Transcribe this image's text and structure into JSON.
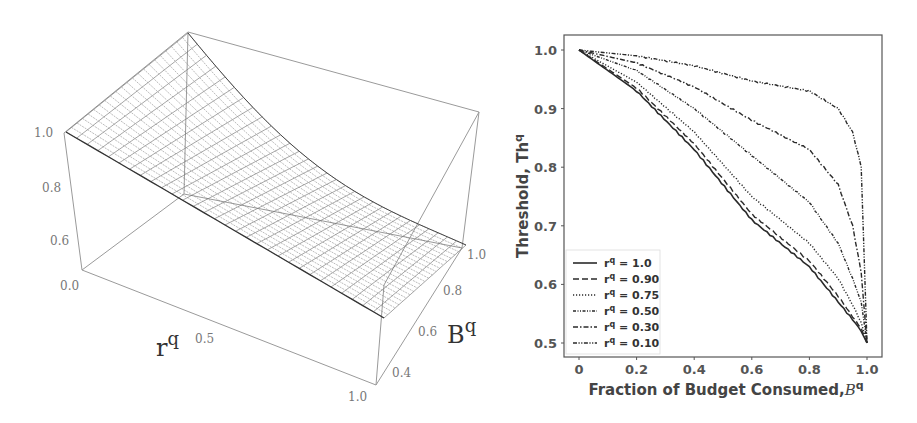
{
  "chart_data": [
    {
      "type": "surface3d",
      "title": "",
      "xlabel": "r^q",
      "ylabel": "B^q",
      "zlabel": "",
      "x_ticks": [
        "0.0",
        "0.5",
        "1.0"
      ],
      "y_ticks": [
        "0.4",
        "0.6",
        "0.8",
        "1.0"
      ],
      "z_ticks": [
        "0.6",
        "0.8",
        "1.0"
      ],
      "xlim": [
        0.0,
        1.0
      ],
      "ylim": [
        0.3,
        1.0
      ],
      "zlim": [
        0.5,
        1.0
      ],
      "description": "Wireframe surface: threshold equals 1.0 along r^q edge at B^q start, decaying toward ~0.5 as B^q approaches 1.0",
      "surface_color": "#555555"
    },
    {
      "type": "line",
      "title": "",
      "xlabel": "Fraction of Budget Consumed, B^q",
      "ylabel": "Threshold, Th^q",
      "xlim": [
        0,
        1.0
      ],
      "ylim": [
        0.5,
        1.0
      ],
      "x_ticks": [
        "0",
        "0.2",
        "0.4",
        "0.6",
        "0.8",
        "1.0"
      ],
      "y_ticks": [
        "0.5",
        "0.6",
        "0.7",
        "0.8",
        "0.9",
        "1.0"
      ],
      "grid": false,
      "legend_position": "lower left",
      "x": [
        0,
        0.2,
        0.4,
        0.6,
        0.8,
        0.9,
        0.95,
        0.98,
        1.0
      ],
      "series": [
        {
          "name": "r^q = 1.0",
          "style": "solid",
          "values": [
            1.0,
            0.93,
            0.83,
            0.71,
            0.63,
            0.57,
            0.54,
            0.52,
            0.5
          ]
        },
        {
          "name": "r^q = 0.90",
          "style": "dashed",
          "values": [
            1.0,
            0.935,
            0.84,
            0.72,
            0.64,
            0.58,
            0.545,
            0.525,
            0.5
          ]
        },
        {
          "name": "r^q = 0.75",
          "style": "dotted",
          "values": [
            1.0,
            0.945,
            0.86,
            0.75,
            0.67,
            0.61,
            0.565,
            0.535,
            0.5
          ]
        },
        {
          "name": "r^q = 0.50",
          "style": "dashdotdot",
          "values": [
            1.0,
            0.965,
            0.9,
            0.82,
            0.74,
            0.67,
            0.61,
            0.57,
            0.5
          ]
        },
        {
          "name": "r^q = 0.30",
          "style": "dashdot",
          "values": [
            1.0,
            0.978,
            0.937,
            0.88,
            0.83,
            0.77,
            0.7,
            0.62,
            0.5
          ]
        },
        {
          "name": "r^q = 0.10",
          "style": "dashdotdot2",
          "values": [
            1.0,
            0.99,
            0.973,
            0.947,
            0.93,
            0.9,
            0.86,
            0.8,
            0.5
          ]
        }
      ]
    }
  ],
  "left_chart": {
    "x_axis_label": "r",
    "x_axis_sup": "q",
    "y_axis_label": "B",
    "y_axis_sup": "q",
    "x_ticks": [
      "0.0",
      "0.5",
      "1.0"
    ],
    "y_ticks": [
      "0.4",
      "0.6",
      "0.8",
      "1.0"
    ],
    "z_ticks": [
      "1.0",
      "0.8",
      "0.6"
    ]
  },
  "right_chart": {
    "ylabel": "Threshold, Th",
    "ylabel_sup": "q",
    "xlabel": "Fraction of Budget Consumed,",
    "xlabel_sym": "B",
    "xlabel_sup": "q",
    "x_ticks": [
      "0",
      "0.2",
      "0.4",
      "0.6",
      "0.8",
      "1.0"
    ],
    "y_ticks": [
      "0.5",
      "0.6",
      "0.7",
      "0.8",
      "0.9",
      "1.0"
    ],
    "legend": [
      {
        "prefix": "r",
        "sup": "q",
        "text": " = 1.0"
      },
      {
        "prefix": "r",
        "sup": "q",
        "text": " = 0.90"
      },
      {
        "prefix": "r",
        "sup": "q",
        "text": " = 0.75"
      },
      {
        "prefix": "r",
        "sup": "q",
        "text": " = 0.50"
      },
      {
        "prefix": "r",
        "sup": "q",
        "text": " = 0.30"
      },
      {
        "prefix": "r",
        "sup": "q",
        "text": " = 0.10"
      }
    ],
    "line_color": "#2a2a2a",
    "axis_color": "#555555"
  }
}
